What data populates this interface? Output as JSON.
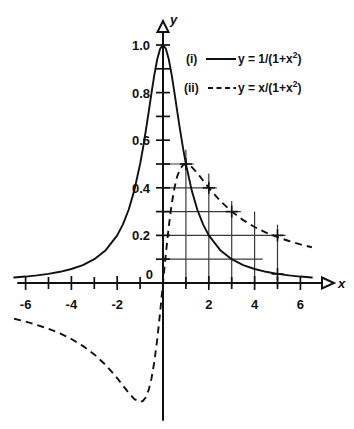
{
  "chart_data": {
    "type": "line",
    "title": "",
    "subtitle": "",
    "xlabel": "x",
    "ylabel": "y",
    "xlim": [
      -6.6,
      6.6
    ],
    "ylim": [
      -0.62,
      1.06
    ],
    "grid": "partial-first-quadrant",
    "legend_position": "upper-right",
    "x_ticks_major": [
      -6,
      -4,
      -2,
      2,
      4,
      6
    ],
    "x_tick_labels": [
      "-6",
      "-4",
      "-2",
      "2",
      "4",
      "6"
    ],
    "x_ticks_all": [
      -6,
      -5,
      -4,
      -3,
      -2,
      -1,
      1,
      2,
      3,
      4,
      5,
      6
    ],
    "y_ticks_major": [
      0,
      0.2,
      0.4,
      0.6,
      0.8,
      1.0
    ],
    "y_tick_labels": [
      "0",
      "0.2",
      "0.4",
      "0.6",
      "0.8",
      "1.0"
    ],
    "y_ticks_all": [
      0.1,
      0.2,
      0.3,
      0.4,
      0.5,
      0.6,
      0.7,
      0.8,
      0.9,
      1.0
    ],
    "origin_label": "0",
    "gridlines_vertical_x": [
      1,
      2,
      3,
      4,
      5
    ],
    "gridlines_horizontal_y": [
      0.1,
      0.2,
      0.3,
      0.4,
      0.5
    ],
    "markers": [
      {
        "x": 1,
        "y": 0.5,
        "series": "both"
      },
      {
        "x": 2,
        "y": 0.4,
        "series": "ii"
      },
      {
        "x": 3,
        "y": 0.3,
        "series": "ii"
      },
      {
        "x": 5,
        "y": 0.2,
        "series": "ii"
      },
      {
        "x": 5,
        "y": 0.038,
        "series": "i"
      }
    ],
    "series": [
      {
        "name": "(i)",
        "formula": "y = 1/(1+x^2)",
        "style": "solid",
        "x": [
          -6.5,
          -6,
          -5.5,
          -5,
          -4.5,
          -4,
          -3.5,
          -3,
          -2.5,
          -2,
          -1.75,
          -1.5,
          -1.25,
          -1,
          -0.875,
          -0.75,
          -0.625,
          -0.5,
          -0.375,
          -0.25,
          -0.125,
          0,
          0.125,
          0.25,
          0.375,
          0.5,
          0.625,
          0.75,
          0.875,
          1,
          1.25,
          1.5,
          1.75,
          2,
          2.5,
          3,
          3.5,
          4,
          4.5,
          5,
          5.5,
          6,
          6.5
        ],
        "values": [
          0.0231,
          0.027,
          0.0321,
          0.0385,
          0.047,
          0.0588,
          0.0755,
          0.1,
          0.1379,
          0.2,
          0.2462,
          0.3077,
          0.3902,
          0.5,
          0.5663,
          0.64,
          0.7191,
          0.8,
          0.8767,
          0.9412,
          0.9846,
          1.0,
          0.9846,
          0.9412,
          0.8767,
          0.8,
          0.7191,
          0.64,
          0.5663,
          0.5,
          0.3902,
          0.3077,
          0.2462,
          0.2,
          0.1379,
          0.1,
          0.0755,
          0.0588,
          0.047,
          0.0385,
          0.0321,
          0.027,
          0.0231
        ]
      },
      {
        "name": "(ii)",
        "formula": "y = x/(1+x^2)",
        "style": "dashed",
        "x": [
          -6.5,
          -6,
          -5.5,
          -5,
          -4.5,
          -4,
          -3.5,
          -3,
          -2.5,
          -2,
          -1.75,
          -1.5,
          -1.25,
          -1,
          -0.875,
          -0.75,
          -0.625,
          -0.5,
          -0.375,
          -0.25,
          -0.125,
          0,
          0.125,
          0.25,
          0.375,
          0.5,
          0.625,
          0.75,
          0.875,
          1,
          1.25,
          1.5,
          1.75,
          2,
          2.5,
          3,
          3.5,
          4,
          4.5,
          5,
          5.5,
          6,
          6.5
        ],
        "values": [
          -0.1502,
          -0.1622,
          -0.1765,
          -0.1923,
          -0.2116,
          -0.2353,
          -0.2642,
          -0.3,
          -0.3448,
          -0.4,
          -0.4308,
          -0.4615,
          -0.4878,
          -0.5,
          -0.4955,
          -0.48,
          -0.4494,
          -0.4,
          -0.3288,
          -0.2353,
          -0.1231,
          0,
          0.1231,
          0.2353,
          0.3288,
          0.4,
          0.4494,
          0.48,
          0.4955,
          0.5,
          0.4878,
          0.4615,
          0.4308,
          0.4,
          0.3448,
          0.3,
          0.2642,
          0.2353,
          0.2116,
          0.1923,
          0.1765,
          0.1622,
          0.1502
        ]
      }
    ]
  },
  "legend": {
    "entries": [
      {
        "key": "(i)",
        "sample": "solid-line",
        "prefix": "y = 1/(1+x",
        "exponent": "2",
        "suffix": ")"
      },
      {
        "key": "(ii)",
        "sample": "dashed-line",
        "prefix": "y = x/(1+x",
        "exponent": "2",
        "suffix": ")"
      }
    ]
  },
  "axes": {
    "x_axis_label": "x",
    "y_axis_label": "y"
  }
}
